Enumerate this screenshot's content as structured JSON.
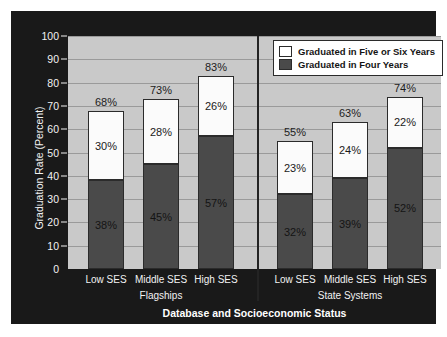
{
  "chart_data": {
    "type": "bar",
    "subtype": "stacked",
    "title": "",
    "xlabel": "Database and Socioeconomic Status",
    "ylabel": "Graduation Rate (Percent)",
    "ylim": [
      0,
      100
    ],
    "ytick_step": 10,
    "ytick_labels": [
      "0",
      "10",
      "20",
      "30",
      "40",
      "50",
      "60",
      "70",
      "80",
      "90",
      "100"
    ],
    "grid": true,
    "legend_position": "top-right",
    "categories": [
      "Low SES",
      "Middle SES",
      "High SES",
      "Low SES",
      "Middle SES",
      "High SES"
    ],
    "groups": [
      {
        "name": "Flagships",
        "categories": [
          "Low SES",
          "Middle SES",
          "High SES"
        ]
      },
      {
        "name": "State Systems",
        "categories": [
          "Low SES",
          "Middle SES",
          "High SES"
        ]
      }
    ],
    "series": [
      {
        "name": "Graduated in Four Years",
        "color": "#4a4a4a",
        "values": [
          38,
          45,
          57,
          32,
          39,
          52
        ],
        "labels": [
          "38%",
          "45%",
          "57%",
          "32%",
          "39%",
          "52%"
        ]
      },
      {
        "name": "Graduated in Five or Six Years",
        "color": "#fbfbfb",
        "values": [
          30,
          28,
          26,
          23,
          24,
          22
        ],
        "labels": [
          "30%",
          "28%",
          "26%",
          "23%",
          "24%",
          "22%"
        ]
      }
    ],
    "totals": [
      68,
      73,
      83,
      55,
      63,
      74
    ],
    "total_labels": [
      "68%",
      "73%",
      "83%",
      "55%",
      "63%",
      "74%"
    ]
  },
  "legend": {
    "items": [
      {
        "label": "Graduated in Five or Six Years",
        "swatch": "white"
      },
      {
        "label": "Graduated in Four Years",
        "swatch": "dark"
      }
    ]
  },
  "colors": {
    "panel_background": "#191919",
    "plot_background": "#c9c9c9",
    "gridline": "#9a9a9a",
    "bar_four_years": "#4a4a4a",
    "bar_five_six_years": "#fbfbfb",
    "axis_text": "#f2f2f2",
    "divider": "#232323"
  }
}
